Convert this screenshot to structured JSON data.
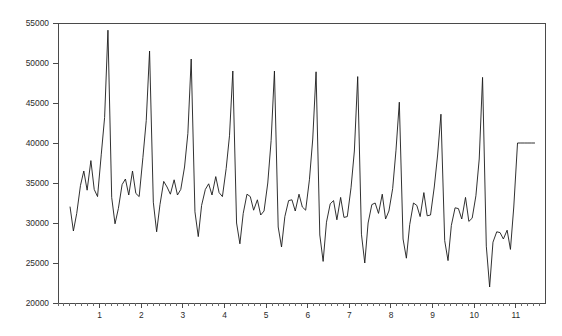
{
  "chart_data": {
    "type": "line",
    "title": "",
    "subtitle": "",
    "xlabel": "",
    "ylabel": "",
    "xlim": [
      0.0,
      11.7
    ],
    "ylim": [
      20000,
      55000
    ],
    "grid": false,
    "legend": null,
    "legend_position": "none",
    "y_ticks": [
      20000,
      25000,
      30000,
      35000,
      40000,
      45000,
      50000,
      55000
    ],
    "y_tick_labels": [
      "20000",
      "25000",
      "30000",
      "35000",
      "40000",
      "45000",
      "50000",
      "55000"
    ],
    "x_ticks": [
      1,
      2,
      3,
      4,
      5,
      6,
      7,
      8,
      9,
      10,
      11
    ],
    "x_tick_labels": [
      "1",
      "2",
      "3",
      "4",
      "5",
      "6",
      "7",
      "8",
      "9",
      "10",
      "11"
    ],
    "x_minor_ticks_per_major": 6,
    "line_color": "#1a1a1a",
    "axis_color": "#4a4a4a",
    "background_color": "#ffffff",
    "series": [
      {
        "name": "series-1",
        "x": [
          0.29,
          0.37,
          0.45,
          0.54,
          0.62,
          0.7,
          0.79,
          0.87,
          0.95,
          1.04,
          1.12,
          1.2,
          1.29,
          1.37,
          1.45,
          1.54,
          1.62,
          1.7,
          1.79,
          1.87,
          1.95,
          2.04,
          2.12,
          2.2,
          2.29,
          2.37,
          2.45,
          2.54,
          2.62,
          2.7,
          2.79,
          2.87,
          2.95,
          3.04,
          3.12,
          3.2,
          3.29,
          3.37,
          3.45,
          3.54,
          3.62,
          3.7,
          3.79,
          3.87,
          3.95,
          4.04,
          4.12,
          4.2,
          4.29,
          4.37,
          4.45,
          4.54,
          4.62,
          4.7,
          4.79,
          4.87,
          4.95,
          5.04,
          5.12,
          5.2,
          5.29,
          5.37,
          5.45,
          5.54,
          5.62,
          5.7,
          5.79,
          5.87,
          5.95,
          6.04,
          6.12,
          6.2,
          6.29,
          6.37,
          6.45,
          6.54,
          6.62,
          6.7,
          6.79,
          6.87,
          6.95,
          7.04,
          7.12,
          7.2,
          7.29,
          7.37,
          7.45,
          7.54,
          7.62,
          7.7,
          7.79,
          7.87,
          7.95,
          8.04,
          8.12,
          8.2,
          8.29,
          8.37,
          8.45,
          8.54,
          8.62,
          8.7,
          8.79,
          8.87,
          8.95,
          9.04,
          9.12,
          9.2,
          9.29,
          9.37,
          9.45,
          9.54,
          9.62,
          9.7,
          9.79,
          9.87,
          9.95,
          10.04,
          10.12,
          10.2,
          10.29,
          10.37,
          10.45,
          10.54,
          10.62,
          10.7,
          10.79,
          10.87,
          10.95,
          11.04,
          11.12,
          11.2,
          11.29,
          11.37,
          11.45
        ],
        "y": [
          32000,
          29000,
          31200,
          34700,
          36500,
          34100,
          37800,
          34200,
          33300,
          38600,
          43200,
          54100,
          33200,
          29900,
          31800,
          34800,
          35500,
          33500,
          36500,
          33700,
          33300,
          38200,
          42800,
          51500,
          32600,
          28900,
          32300,
          35200,
          34500,
          33600,
          35400,
          33500,
          34200,
          37000,
          41200,
          50500,
          31400,
          28300,
          32200,
          34200,
          34900,
          33500,
          35800,
          33800,
          33300,
          36800,
          40900,
          49000,
          30000,
          27400,
          31200,
          33600,
          33300,
          31600,
          32900,
          31000,
          31500,
          35000,
          40300,
          49000,
          29500,
          27000,
          30800,
          32800,
          32900,
          31500,
          33600,
          32000,
          31600,
          35400,
          40500,
          48900,
          28500,
          25200,
          30100,
          32400,
          32800,
          30400,
          33200,
          30700,
          30800,
          34400,
          39000,
          48300,
          28600,
          25000,
          30000,
          32300,
          32500,
          31200,
          33600,
          30500,
          31500,
          34300,
          39100,
          45100,
          28000,
          25600,
          29800,
          32500,
          32200,
          30800,
          33800,
          30900,
          31000,
          34500,
          38500,
          43600,
          27800,
          25300,
          29700,
          31900,
          31800,
          30500,
          33200,
          30200,
          30600,
          33400,
          38000,
          48200,
          27100,
          22000,
          27600,
          28900,
          28800,
          28000,
          29100,
          26700,
          32000,
          40000,
          40000,
          40000,
          40000,
          40000,
          40000
        ]
      }
    ]
  },
  "figure": {
    "width": 562,
    "height": 336,
    "plot_left": 58,
    "plot_right": 545,
    "plot_top": 23,
    "plot_bottom": 303
  }
}
